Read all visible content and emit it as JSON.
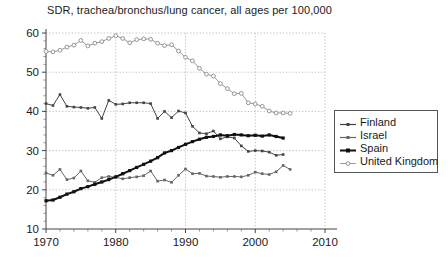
{
  "chart_data": {
    "type": "line",
    "title": "SDR, trachea/bronchus/lung cancer, all ages per 100,000",
    "xlabel": "",
    "ylabel": "",
    "xlim": [
      1970,
      2010
    ],
    "ylim": [
      10,
      60
    ],
    "xticks": [
      1970,
      1980,
      1990,
      2000,
      2010
    ],
    "yticks": [
      10,
      20,
      30,
      40,
      50,
      60
    ],
    "grid": true,
    "legend_position": "right",
    "series": [
      {
        "name": "Finland",
        "color": "#444444",
        "marker": "square-small",
        "line_width": 1,
        "x": [
          1970,
          1971,
          1972,
          1973,
          1974,
          1975,
          1976,
          1977,
          1978,
          1979,
          1980,
          1981,
          1982,
          1983,
          1984,
          1985,
          1986,
          1987,
          1988,
          1989,
          1990,
          1991,
          1992,
          1993,
          1994,
          1995,
          1996,
          1997,
          1998,
          1999,
          2000,
          2001,
          2002,
          2003,
          2004
        ],
        "values": [
          42.0,
          41.5,
          44.3,
          41.3,
          41.1,
          41.0,
          40.8,
          41.0,
          38.2,
          42.8,
          41.8,
          41.9,
          42.2,
          42.2,
          42.2,
          42.0,
          38.2,
          40.0,
          38.4,
          40.1,
          39.6,
          36.2,
          34.5,
          34.3,
          35.0,
          33.0,
          33.5,
          33.2,
          31.2,
          29.8,
          30.0,
          29.9,
          29.6,
          28.8,
          29.0
        ]
      },
      {
        "name": "Israel",
        "color": "#666666",
        "marker": "square-small",
        "line_width": 1,
        "x": [
          1970,
          1971,
          1972,
          1973,
          1974,
          1975,
          1976,
          1977,
          1978,
          1979,
          1980,
          1981,
          1982,
          1983,
          1984,
          1985,
          1986,
          1987,
          1988,
          1989,
          1990,
          1991,
          1992,
          1993,
          1994,
          1995,
          1996,
          1997,
          1998,
          1999,
          2000,
          2001,
          2002,
          2003,
          2004,
          2005
        ],
        "values": [
          24.3,
          23.7,
          25.2,
          22.6,
          23.0,
          24.8,
          22.3,
          21.9,
          23.1,
          23.4,
          23.2,
          22.8,
          23.1,
          23.3,
          23.6,
          24.8,
          22.2,
          22.5,
          21.9,
          23.7,
          25.3,
          24.1,
          24.2,
          23.5,
          23.4,
          23.2,
          23.4,
          23.4,
          23.3,
          23.7,
          24.5,
          24.1,
          23.9,
          24.6,
          26.2,
          25.2
        ]
      },
      {
        "name": "Spain",
        "color": "#111111",
        "marker": "square-small",
        "line_width": 2,
        "x": [
          1970,
          1971,
          1972,
          1973,
          1974,
          1975,
          1976,
          1977,
          1978,
          1979,
          1980,
          1981,
          1982,
          1983,
          1984,
          1985,
          1986,
          1987,
          1988,
          1989,
          1990,
          1991,
          1992,
          1993,
          1994,
          1995,
          1996,
          1997,
          1998,
          1999,
          2000,
          2001,
          2002,
          2003,
          2004
        ],
        "values": [
          17.2,
          17.4,
          18.1,
          18.9,
          19.5,
          20.3,
          20.8,
          21.4,
          22.0,
          22.6,
          23.3,
          24.1,
          24.9,
          25.7,
          26.5,
          27.3,
          28.2,
          29.4,
          30.0,
          30.8,
          31.6,
          32.3,
          32.9,
          33.4,
          33.6,
          34.0,
          33.8,
          34.1,
          34.0,
          33.8,
          33.9,
          33.7,
          34.0,
          33.6,
          33.2
        ]
      },
      {
        "name": "United Kingdom",
        "color": "#999999",
        "marker": "circle-open",
        "line_width": 1,
        "x": [
          1970,
          1971,
          1972,
          1973,
          1974,
          1975,
          1976,
          1977,
          1978,
          1979,
          1980,
          1981,
          1982,
          1983,
          1984,
          1985,
          1986,
          1987,
          1988,
          1989,
          1990,
          1991,
          1992,
          1993,
          1994,
          1995,
          1996,
          1997,
          1998,
          1999,
          2000,
          2001,
          2002,
          2003,
          2004,
          2005
        ],
        "values": [
          55.3,
          55.2,
          55.6,
          56.4,
          56.9,
          58.1,
          56.7,
          57.4,
          57.8,
          58.6,
          59.3,
          58.6,
          57.5,
          58.3,
          58.5,
          58.4,
          57.4,
          56.8,
          57.0,
          55.4,
          53.8,
          52.9,
          51.0,
          49.5,
          49.0,
          47.1,
          45.8,
          44.5,
          44.6,
          42.2,
          41.9,
          41.3,
          40.1,
          39.6,
          39.6,
          39.5
        ]
      }
    ]
  },
  "legend": {
    "items": [
      {
        "label": "Finland"
      },
      {
        "label": "Israel"
      },
      {
        "label": "Spain"
      },
      {
        "label": "United Kingdom"
      }
    ]
  },
  "axes": {
    "x_tick_labels": [
      "1970",
      "1980",
      "1990",
      "2000",
      "2010"
    ],
    "y_tick_labels": [
      "10",
      "20",
      "30",
      "40",
      "50",
      "60"
    ]
  }
}
